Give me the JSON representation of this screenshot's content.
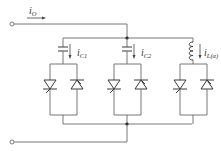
{
  "diagram": {
    "title": "",
    "labels": {
      "input_current": {
        "main": "i",
        "sub": "O"
      },
      "cap1_current": {
        "main": "i",
        "sub": "C1"
      },
      "cap2_current": {
        "main": "i",
        "sub": "C2"
      },
      "inductor_current": {
        "main": "i",
        "sub": "L(α)"
      }
    },
    "branches": [
      {
        "id": "branch-1",
        "element": "capacitor",
        "current_label": "iC1",
        "devices": [
          "thyristor-forward",
          "thyristor-reverse"
        ]
      },
      {
        "id": "branch-2",
        "element": "capacitor",
        "current_label": "iC2",
        "devices": [
          "thyristor-forward",
          "thyristor-reverse"
        ]
      },
      {
        "id": "branch-3",
        "element": "inductor",
        "current_label": "iL(α)",
        "devices": [
          "thyristor-forward",
          "thyristor-reverse"
        ]
      }
    ],
    "terminals": [
      "top-terminal",
      "bottom-terminal"
    ],
    "colors": {
      "wire": "#6a6a6a",
      "device": "#3a3a3a",
      "text": "#333333"
    }
  }
}
